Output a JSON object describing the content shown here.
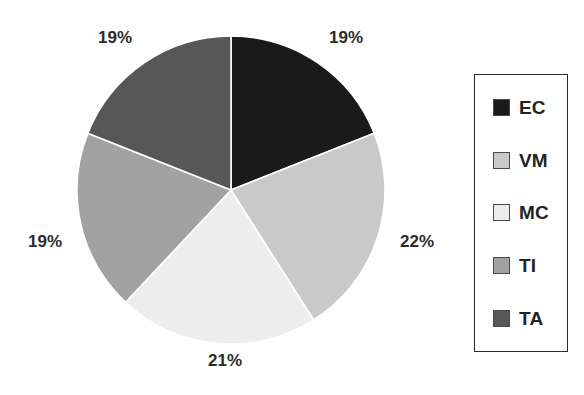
{
  "chart_data": {
    "type": "pie",
    "title": "",
    "subtitle": "",
    "xlabel": "",
    "ylabel": "",
    "grid": false,
    "legend_position": "right",
    "start_angle_deg": 0,
    "direction": "clockwise",
    "categories": [
      "EC",
      "VM",
      "MC",
      "TI",
      "TA"
    ],
    "values": [
      19,
      22,
      21,
      19,
      19
    ],
    "value_unit": "%",
    "data_labels": [
      "19%",
      "22%",
      "21%",
      "19%",
      "19%"
    ],
    "colors": [
      "#1a1a1a",
      "#c9c9c9",
      "#ededed",
      "#a2a2a2",
      "#575757"
    ],
    "slices": [
      {
        "label": "EC",
        "value": 19,
        "data_label": "19%",
        "color": "#1a1a1a",
        "start_deg": 0,
        "end_deg": 68.4
      },
      {
        "label": "VM",
        "value": 22,
        "data_label": "22%",
        "color": "#c9c9c9",
        "start_deg": 68.4,
        "end_deg": 147.6
      },
      {
        "label": "MC",
        "value": 21,
        "data_label": "21%",
        "color": "#ededed",
        "start_deg": 147.6,
        "end_deg": 223.2
      },
      {
        "label": "TI",
        "value": 19,
        "data_label": "19%",
        "color": "#a2a2a2",
        "start_deg": 223.2,
        "end_deg": 291.6
      },
      {
        "label": "TA",
        "value": 19,
        "data_label": "19%",
        "color": "#575757",
        "start_deg": 291.6,
        "end_deg": 360
      }
    ]
  },
  "pie": {
    "center_x": 231,
    "center_y": 190,
    "radius": 154,
    "slice_edge_color": "#ffffff",
    "labels": [
      {
        "text": "19%",
        "left": 329,
        "top": 28
      },
      {
        "text": "22%",
        "left": 400,
        "top": 232
      },
      {
        "text": "21%",
        "left": 208,
        "top": 351
      },
      {
        "text": "19%",
        "left": 28,
        "top": 232
      },
      {
        "text": "19%",
        "left": 98,
        "top": 28
      }
    ]
  },
  "legend": {
    "items": [
      {
        "label": "EC",
        "color": "#1a1a1a"
      },
      {
        "label": "VM",
        "color": "#c9c9c9"
      },
      {
        "label": "MC",
        "color": "#ededed"
      },
      {
        "label": "TI",
        "color": "#a2a2a2"
      },
      {
        "label": "TA",
        "color": "#575757"
      }
    ]
  }
}
